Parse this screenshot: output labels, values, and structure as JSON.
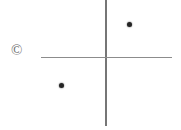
{
  "figure": {
    "width": 181,
    "height": 130,
    "background_color": "#ffffff",
    "caption_mark": "©",
    "caption_mark_name": "copyright-icon"
  },
  "chart_data": {
    "type": "scatter",
    "title": "",
    "subtitle": "",
    "xlabel": "",
    "ylabel": "",
    "grid": false,
    "legend": null,
    "axes": {
      "style": "crosshair",
      "color": "#808080",
      "line_width_px": 1.5,
      "origin_px": {
        "x": 106,
        "y": 57.5
      },
      "vertical": {
        "x_px": 106,
        "y_start_px": 0,
        "y_end_px": 126,
        "color": "#767676"
      },
      "horizontal": {
        "y_px": 57.5,
        "x_start_px": 41,
        "x_end_px": 172,
        "color": "#8c8c8c"
      }
    },
    "xlim": [
      -65,
      66
    ],
    "ylim": [
      -68,
      58
    ],
    "points": [
      {
        "label": "point-1",
        "x": 23,
        "y": 34,
        "px": {
          "x": 129,
          "y": 24
        },
        "quadrant": "upper-right",
        "color": "#242424",
        "size_px": 5
      },
      {
        "label": "point-2",
        "x": -45,
        "y": -27,
        "px": {
          "x": 61,
          "y": 85
        },
        "quadrant": "lower-left",
        "color": "#242424",
        "size_px": 5
      }
    ],
    "annotations": [
      {
        "text": "©",
        "px": {
          "x": 18,
          "y": 50
        },
        "color": "#6b6b6b"
      }
    ]
  }
}
